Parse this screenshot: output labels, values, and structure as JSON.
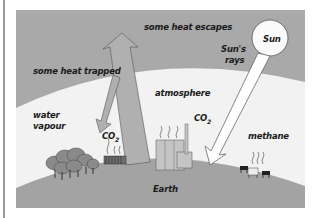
{
  "diagram": {
    "labels": {
      "heat_escapes": "some heat escapes",
      "heat_trapped": "some heat trapped",
      "sun": "Sun",
      "suns_rays_line1": "Sun's",
      "suns_rays_line2": "rays",
      "water_vapour_line1": "water",
      "water_vapour_line2": "vapour",
      "atmosphere": "atmosphere",
      "co2_left": "CO",
      "co2_left_sub": "2",
      "co2_right": "CO",
      "co2_right_sub": "2",
      "methane": "methane",
      "earth": "Earth"
    },
    "colors": {
      "space": "#a9a9a9",
      "atmosphere": "#f2f2f2",
      "earth": "#a3a3a3",
      "arrow_heat": "#b0b0b0",
      "arrow_sun": "#ffffff",
      "outline": "#555555"
    }
  }
}
